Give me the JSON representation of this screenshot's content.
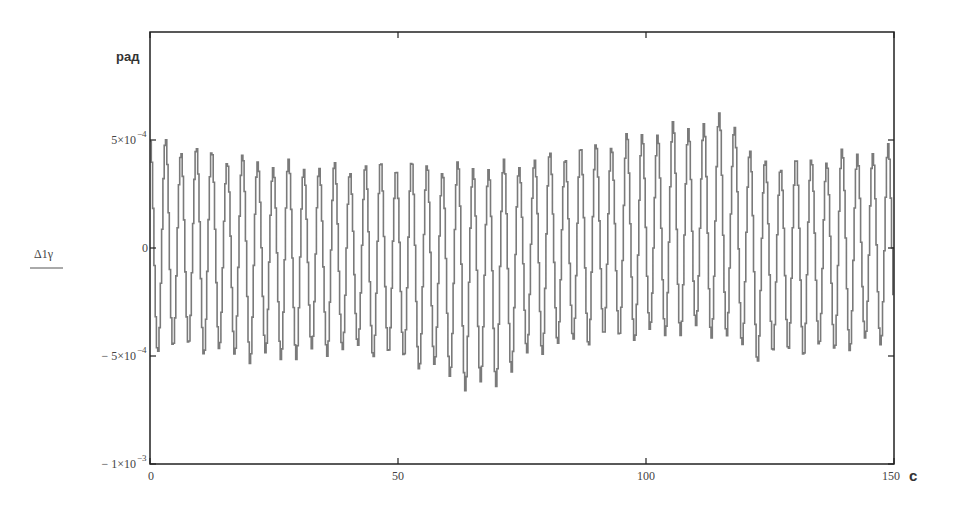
{
  "chart_data": {
    "type": "line",
    "title": "",
    "xlabel": "c",
    "ylabel": "Δ1γ",
    "y_unit": "рад",
    "xlim": [
      0,
      150
    ],
    "ylim": [
      -0.001,
      0.001
    ],
    "grid": false,
    "legend": null,
    "x_ticks": [
      {
        "value": 0,
        "label": "0"
      },
      {
        "value": 50,
        "label": "50"
      },
      {
        "value": 100,
        "label": "100"
      },
      {
        "value": 150,
        "label": "150"
      }
    ],
    "y_ticks": [
      {
        "value": 0.0005,
        "mantissa": "5×10",
        "exp": "−4",
        "label": "5×10^-4"
      },
      {
        "value": 0,
        "mantissa": "0",
        "exp": "",
        "label": "0"
      },
      {
        "value": -0.0005,
        "mantissa": "− 5×10",
        "exp": "−4",
        "label": "-5×10^-4"
      },
      {
        "value": -0.001,
        "mantissa": "− 1×10",
        "exp": "−3",
        "label": "-1×10^-3"
      }
    ],
    "series": [
      {
        "name": "Δ1γ",
        "color": "#7a7a7a",
        "description": "Oscillation with period ~3.1 s, amplitude ~4–6×10^-4 rad, slowly modulated envelope",
        "period_s": 3.1,
        "envelope": {
          "t": [
            0,
            10,
            20,
            30,
            40,
            50,
            60,
            65,
            70,
            75,
            80,
            90,
            100,
            110,
            115,
            117,
            119,
            122,
            130,
            140,
            150
          ],
          "amplitude": [
            0.00048,
            0.00046,
            0.00046,
            0.00044,
            0.00042,
            0.00045,
            0.00048,
            0.00052,
            0.0005,
            0.00046,
            0.00044,
            0.00045,
            0.00047,
            0.00048,
            0.0005,
            0.00052,
            0.0005,
            0.00045,
            0.00044,
            0.00045,
            0.00044
          ],
          "offset": [
            0.0,
            0.0,
            -3e-05,
            -5e-05,
            -6e-05,
            -8e-05,
            -0.00011,
            -0.00013,
            -0.0001,
            -4e-05,
            0.0,
            2e-05,
            4e-05,
            8e-05,
            0.0001,
            0.00011,
            4e-05,
            -4e-05,
            -2e-05,
            -1e-05,
            0.0
          ]
        },
        "approx_peaks": {
          "max": {
            "t": 117,
            "value": 0.00063
          },
          "min": {
            "t": 67,
            "value": -0.00061
          }
        }
      }
    ]
  },
  "axes": {
    "y_unit_label": "рад",
    "x_unit_label": "c",
    "y_name_label": "Δ1γ"
  }
}
